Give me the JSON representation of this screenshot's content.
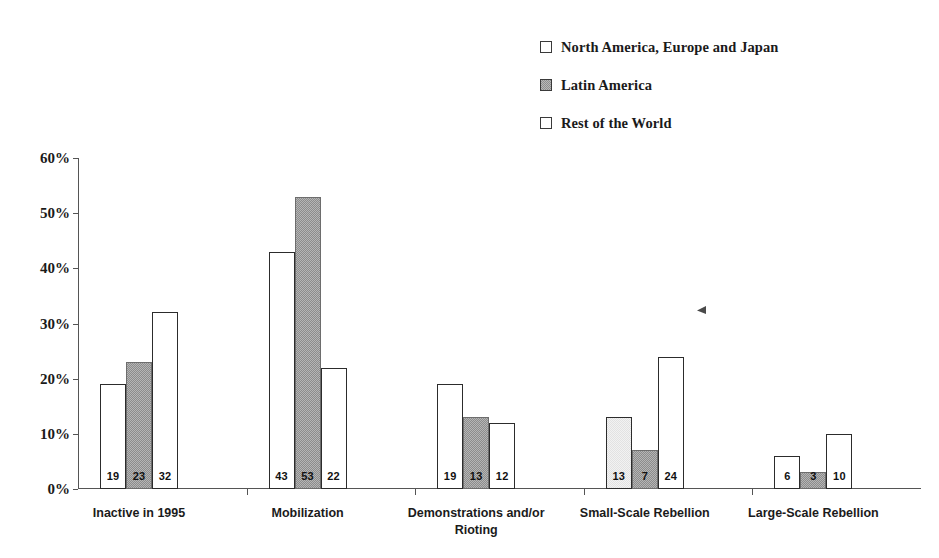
{
  "chart_data": {
    "type": "bar",
    "title": "",
    "subtitle": "",
    "xlabel": "",
    "ylabel": "",
    "ylim": [
      0,
      60
    ],
    "ytick_values": [
      0,
      10,
      20,
      30,
      40,
      50,
      60
    ],
    "ytick_labels": [
      "0%",
      "10%",
      "20%",
      "30%",
      "40%",
      "50%",
      "60%"
    ],
    "grid": false,
    "legend_position": "top-right",
    "categories": [
      "Inactive in 1995",
      "Mobilization",
      "Demonstrations and/or\nRioting",
      "Small-Scale Rebellion",
      "Large-Scale Rebellion"
    ],
    "series": [
      {
        "name": "North America, Europe and Japan",
        "fill": "white",
        "color": "#ffffff",
        "values": [
          19,
          43,
          19,
          13,
          6
        ],
        "labels": [
          "19",
          "43",
          "19",
          "13",
          "6"
        ]
      },
      {
        "name": "Latin America",
        "fill": "gray-dither",
        "color": "#b5b5b5",
        "values": [
          23,
          53,
          13,
          7,
          3
        ],
        "labels": [
          "23",
          "53",
          "13",
          "7",
          "3"
        ]
      },
      {
        "name": "Rest of the World",
        "fill": "white",
        "color": "#ffffff",
        "values": [
          32,
          22,
          12,
          24,
          10
        ],
        "labels": [
          "32",
          "22",
          "12",
          "24",
          "10"
        ]
      }
    ],
    "annotations": [
      {
        "name": "scan-speck",
        "x_px": 697,
        "y_px": 306
      }
    ]
  },
  "legend": {
    "items": [
      {
        "label": "North America, Europe and Japan",
        "swatch": "outline-swatch"
      },
      {
        "label": "Latin America",
        "swatch": "gray-swatch"
      },
      {
        "label": "Rest of the World",
        "swatch": "outline-swatch"
      }
    ]
  }
}
